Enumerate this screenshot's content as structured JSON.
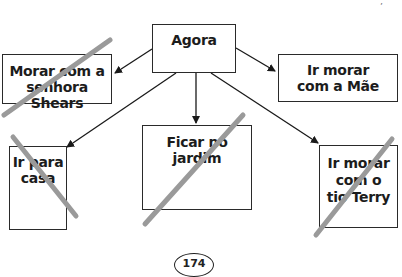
{
  "diagram": {
    "root": {
      "label": "Agora"
    },
    "options": [
      {
        "id": "shears",
        "lines": [
          "Morar com a",
          "senhora Shears"
        ],
        "crossed_out": true
      },
      {
        "id": "mae",
        "lines": [
          "Ir morar",
          "com a Mãe"
        ],
        "crossed_out": false
      },
      {
        "id": "casa",
        "lines": [
          "Ir para",
          "casa"
        ],
        "crossed_out": true
      },
      {
        "id": "jardim",
        "lines": [
          "Ficar no",
          "jardim"
        ],
        "crossed_out": true
      },
      {
        "id": "terry",
        "lines": [
          "Ir morar",
          "com o",
          "tio Terry"
        ],
        "crossed_out": true
      }
    ],
    "colors": {
      "box_border": "#2a2a2a",
      "text": "#1c1c1c",
      "strike": "#9a9a9a",
      "arrow": "#1a1a1a"
    }
  },
  "page": {
    "number": "174",
    "corner_mark": "’"
  }
}
